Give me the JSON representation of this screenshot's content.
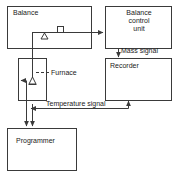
{
  "diagram": {
    "stroke_color": "#3a3a3a",
    "text_color": "#1a1a1a",
    "background_color": "#ffffff",
    "blocks": [
      {
        "id": "balance",
        "label": "Balance",
        "x": 7,
        "y": 6,
        "w": 84,
        "h": 42
      },
      {
        "id": "control-unit",
        "label": "Balance\ncontrol\nunit",
        "x": 105,
        "y": 6,
        "w": 67,
        "h": 42
      },
      {
        "id": "recorder",
        "label": "Recorder",
        "x": 105,
        "y": 58,
        "w": 67,
        "h": 42
      },
      {
        "id": "furnace",
        "label": "Furnace",
        "x": 18,
        "y": 58,
        "w": 28,
        "h": 42
      },
      {
        "id": "programmer",
        "label": "Programmer",
        "x": 7,
        "y": 128,
        "w": 69,
        "h": 42
      }
    ],
    "symbols": [
      {
        "id": "balance-beam-pivot",
        "shape": "triangle",
        "x": 44,
        "y": 31
      },
      {
        "id": "counterweight",
        "shape": "square",
        "x": 60,
        "y": 29
      },
      {
        "id": "sample-crucible",
        "shape": "crucible",
        "x": 31,
        "y": 76
      }
    ],
    "signals": [
      {
        "id": "mass-signal",
        "label": "Mass signal",
        "direction": "down"
      },
      {
        "id": "temperature-signal",
        "label": "Temperature signal",
        "direction": "left-and-up"
      }
    ]
  }
}
